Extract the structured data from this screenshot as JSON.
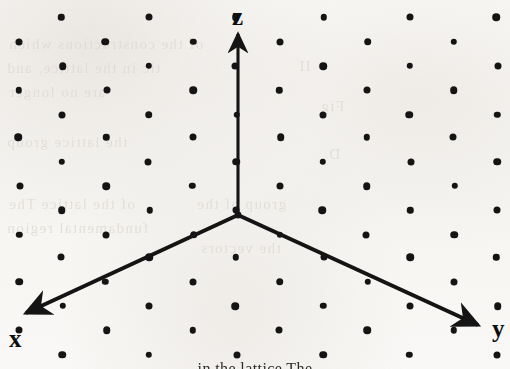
{
  "figure": {
    "background_color": "#f8f7f5",
    "ink_color": "#141414",
    "width": 510,
    "height": 369
  },
  "axes": {
    "origin": {
      "x": 238,
      "y": 215
    },
    "items": [
      {
        "id": "z",
        "label": "z",
        "label_x": 232,
        "label_y": 4,
        "tip_x": 238,
        "tip_y": 30,
        "direction": "up"
      },
      {
        "id": "x",
        "label": "x",
        "label_x": 9,
        "label_y": 326,
        "tip_x": 16,
        "tip_y": 319,
        "direction": "down-left"
      },
      {
        "id": "y",
        "label": "y",
        "label_x": 492,
        "label_y": 316,
        "tip_x": 492,
        "tip_y": 331,
        "direction": "down-right"
      }
    ]
  },
  "lattice": {
    "description": "staggered point lattice",
    "dot_diameter": 7,
    "column_spacing": 87,
    "row_spacing": 24,
    "row_offset_x": 43,
    "origin_x": 62,
    "origin_y": 18,
    "rows": 15,
    "columns": 7
  },
  "bleed_through_text": [
    {
      "text": "of the constructions which",
      "x": 8,
      "y": 36
    },
    {
      "text": "tic in the lattice, and",
      "x": 6,
      "y": 60
    },
    {
      "text": "are no longer",
      "x": 8,
      "y": 84
    },
    {
      "text": "the lattice group",
      "x": 6,
      "y": 134
    },
    {
      "text": "of the lattice The",
      "x": 8,
      "y": 196
    },
    {
      "text": "fundamental region",
      "x": 6,
      "y": 220
    },
    {
      "text": "group of the",
      "x": 196,
      "y": 196
    },
    {
      "text": "the vectors",
      "x": 200,
      "y": 240
    },
    {
      "text": "II",
      "x": 298,
      "y": 58
    },
    {
      "text": "Fig",
      "x": 320,
      "y": 98
    },
    {
      "text": "D",
      "x": 328,
      "y": 146
    }
  ],
  "bottom_caption": "in the lattice The"
}
